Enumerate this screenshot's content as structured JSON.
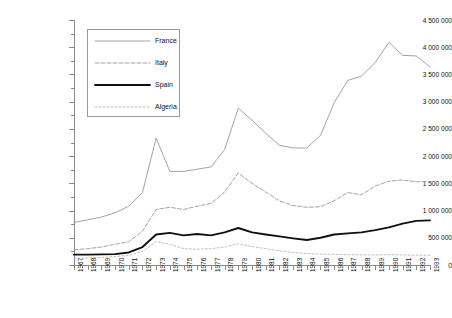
{
  "chart_data": {
    "type": "line",
    "title": "",
    "xlabel": "",
    "ylabel": "US$ 000 (1990)",
    "xlim": [
      1967,
      1993
    ],
    "ylim": [
      0,
      4500000
    ],
    "ytick_step": 500000,
    "grid": false,
    "legend_position": "top-left-inside",
    "x": [
      1967,
      1968,
      1969,
      1970,
      1971,
      1972,
      1973,
      1974,
      1975,
      1976,
      1977,
      1978,
      1979,
      1980,
      1981,
      1982,
      1983,
      1984,
      1985,
      1986,
      1987,
      1988,
      1989,
      1990,
      1991,
      1992,
      1993
    ],
    "categories": [
      "1967",
      "1968",
      "1969",
      "1970",
      "1971",
      "1972",
      "1973",
      "1974",
      "1975",
      "1976",
      "1977",
      "1978",
      "1979",
      "1980",
      "1981",
      "1982",
      "1983",
      "1984",
      "1985",
      "1986",
      "1987",
      "1988",
      "1989",
      "1990",
      "1991",
      "1992",
      "1993"
    ],
    "yticks": [
      0,
      500000,
      1000000,
      1500000,
      2000000,
      2500000,
      3000000,
      3500000,
      4000000,
      4500000
    ],
    "ytick_labels": [
      "0",
      "500 000",
      "1 000 000",
      "1 500 000",
      "2 000 000",
      "2 500 000",
      "3 000 000",
      "3 500 000",
      "4 000 000",
      "4 500 000"
    ],
    "series": [
      {
        "name": "France",
        "style": "solid-thin",
        "color": "#8c8c8c",
        "values": [
          780000,
          830000,
          880000,
          960000,
          1080000,
          1330000,
          2330000,
          1720000,
          1720000,
          1760000,
          1800000,
          2120000,
          2880000,
          2660000,
          2420000,
          2200000,
          2150000,
          2150000,
          2380000,
          2980000,
          3390000,
          3470000,
          3720000,
          4090000,
          3850000,
          3840000,
          3640000
        ]
      },
      {
        "name": "Italy",
        "style": "dashed",
        "color": "#9a9a9a",
        "values": [
          280000,
          300000,
          330000,
          380000,
          430000,
          620000,
          1020000,
          1060000,
          1020000,
          1080000,
          1130000,
          1340000,
          1690000,
          1500000,
          1340000,
          1180000,
          1090000,
          1060000,
          1070000,
          1180000,
          1330000,
          1290000,
          1450000,
          1540000,
          1560000,
          1530000,
          1530000
        ]
      },
      {
        "name": "Spain",
        "style": "solid-thick",
        "color": "#111111",
        "values": [
          190000,
          190000,
          195000,
          200000,
          230000,
          330000,
          560000,
          590000,
          545000,
          570000,
          545000,
          600000,
          680000,
          600000,
          560000,
          525000,
          490000,
          460000,
          500000,
          560000,
          580000,
          600000,
          640000,
          690000,
          760000,
          810000,
          820000
        ]
      },
      {
        "name": "Algeria",
        "style": "dotted",
        "color": "#b0b0b0",
        "values": [
          120000,
          130000,
          140000,
          155000,
          175000,
          250000,
          430000,
          380000,
          300000,
          290000,
          300000,
          330000,
          390000,
          340000,
          300000,
          260000,
          230000,
          210000,
          200000,
          195000,
          190000,
          185000,
          185000,
          190000,
          185000,
          180000,
          180000
        ]
      }
    ]
  },
  "legend": {
    "items": [
      {
        "label": "France"
      },
      {
        "label": "Italy"
      },
      {
        "label": "Spain"
      },
      {
        "label": "Algeria"
      }
    ]
  }
}
